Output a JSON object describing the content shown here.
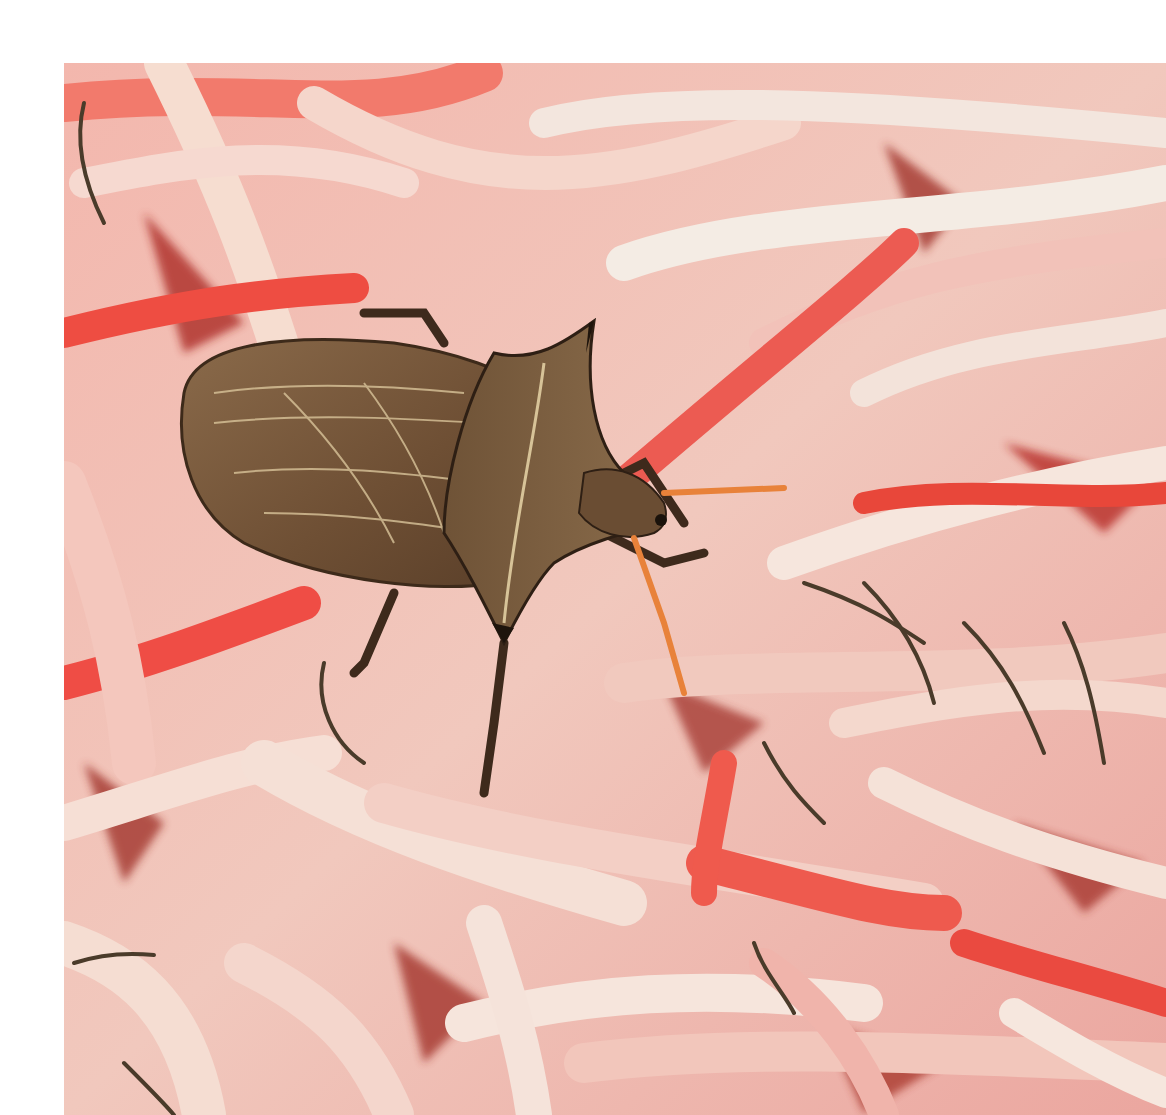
{
  "image": {
    "alt": "Close-up photograph of a brown shield bug (stink bug) resting on a dense cluster of pink, red and cream flower petals and stamens",
    "subject": "shield bug",
    "background": "pink and red flower petals with dark stamens",
    "border_color": "#ffffff",
    "palette": {
      "petal_pink": "#f4a6a4",
      "petal_red": "#e8473a",
      "petal_cream": "#f6e4d6",
      "petal_deep_red": "#b3241f",
      "bug_brown": "#7a5a3c",
      "bug_dark": "#4a3322",
      "bug_vein": "#d9c49a",
      "antenna_orange": "#e8823a",
      "stamen_dark": "#4a3b2a"
    }
  }
}
